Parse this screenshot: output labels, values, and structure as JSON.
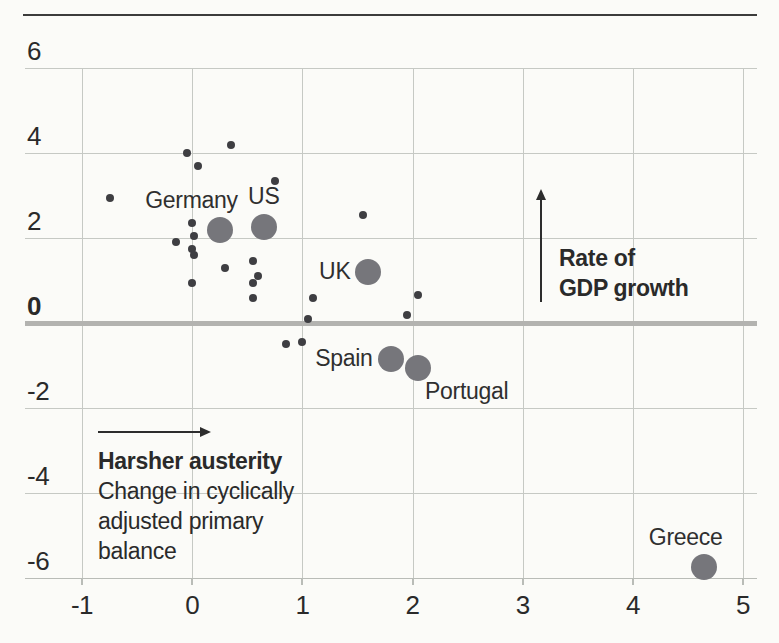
{
  "colors": {
    "background": "#fbfbf8",
    "top_rule": "#3c3c3c",
    "grid": "#c6c9c4",
    "axis_line": "#b9bcb7",
    "zero_line": "#b3b3b0",
    "small_dot": "#3e3e42",
    "bubble": "#76767b",
    "text": "#2a2a2a"
  },
  "chart_data": {
    "type": "scatter",
    "title": "",
    "xlabel": "Change in cyclically adjusted primary balance",
    "ylabel": "Rate of GDP growth",
    "xlim": [
      -1.52,
      5.13
    ],
    "ylim": [
      -6,
      6
    ],
    "grid": true,
    "zero_line_y": 0,
    "x_ticks": [
      {
        "value": -1,
        "label": "-1"
      },
      {
        "value": 0,
        "label": "0"
      },
      {
        "value": 1,
        "label": "1"
      },
      {
        "value": 2,
        "label": "2"
      },
      {
        "value": 3,
        "label": "3"
      },
      {
        "value": 4,
        "label": "4"
      },
      {
        "value": 5,
        "label": "5"
      }
    ],
    "y_ticks": [
      {
        "value": 6,
        "label": "6"
      },
      {
        "value": 4,
        "label": "4"
      },
      {
        "value": 2,
        "label": "2"
      },
      {
        "value": 0,
        "label": "0",
        "bold": true
      },
      {
        "value": -2,
        "label": "-2"
      },
      {
        "value": -4,
        "label": "-4"
      },
      {
        "value": -6,
        "label": "-6"
      }
    ],
    "series": [
      {
        "name": "labeled-countries",
        "marker": "bubble",
        "points": [
          {
            "label": "Germany",
            "x": 0.25,
            "y": 2.2,
            "label_pos": "above-left"
          },
          {
            "label": "US",
            "x": 0.65,
            "y": 2.25,
            "label_pos": "above"
          },
          {
            "label": "UK",
            "x": 1.6,
            "y": 1.2,
            "label_pos": "left"
          },
          {
            "label": "Spain",
            "x": 1.8,
            "y": -0.85,
            "label_pos": "left"
          },
          {
            "label": "Portugal",
            "x": 2.05,
            "y": -1.05,
            "label_pos": "below-right"
          },
          {
            "label": "Greece",
            "x": 4.65,
            "y": -5.75,
            "label_pos": "above-left"
          }
        ]
      },
      {
        "name": "other-countries",
        "marker": "dot",
        "points": [
          [
            0.35,
            4.2
          ],
          [
            -0.05,
            4.0
          ],
          [
            0.05,
            3.7
          ],
          [
            0.75,
            3.35
          ],
          [
            -0.75,
            2.95
          ],
          [
            1.55,
            2.55
          ],
          [
            0.0,
            2.35
          ],
          [
            0.02,
            2.05
          ],
          [
            -0.15,
            1.9
          ],
          [
            0.0,
            1.75
          ],
          [
            0.02,
            1.6
          ],
          [
            0.55,
            1.45
          ],
          [
            0.3,
            1.3
          ],
          [
            0.6,
            1.1
          ],
          [
            0.55,
            0.95
          ],
          [
            0.0,
            0.95
          ],
          [
            0.55,
            0.6
          ],
          [
            1.1,
            0.6
          ],
          [
            2.05,
            0.65
          ],
          [
            1.95,
            0.2
          ],
          [
            1.05,
            0.1
          ],
          [
            1.0,
            -0.45
          ],
          [
            0.85,
            -0.5
          ]
        ]
      }
    ],
    "annotations": {
      "gdp_growth": {
        "line1": "Rate of",
        "line2": "GDP growth"
      },
      "austerity": {
        "bold_line": "Harsher austerity",
        "line1": "Change in cyclically",
        "line2": "adjusted primary",
        "line3": "balance"
      }
    }
  }
}
